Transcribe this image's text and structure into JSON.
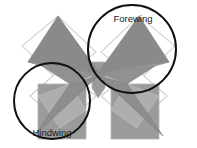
{
  "figure": {
    "background_color": "#ffffff",
    "width": 197,
    "height": 148,
    "palette": {
      "wing_fill_dark": "#8a8a8a",
      "wing_fill_mid": "#949494",
      "wing_fill_light": "#a8a8a8",
      "wing_fill_pale": "#c4c4c4",
      "outline_white": "#f4f4f4",
      "outline_gray": "#b9b9b9",
      "annotation_stroke": "#111111",
      "label_color": "#1a1a1a"
    },
    "annotations": [
      {
        "id": "forewing",
        "label": "Forewing",
        "circle": {
          "cx": 132,
          "cy": 49,
          "r": 44
        },
        "label_x": 133,
        "label_y": 22,
        "anchor": "middle"
      },
      {
        "id": "hindwing",
        "label": "Hindwing",
        "circle": {
          "cx": 52,
          "cy": 101,
          "r": 38
        },
        "label_x": 52,
        "label_y": 136,
        "anchor": "middle"
      }
    ],
    "shapes": {
      "outline_diamond_upper_left": "22,46 58,16 96,52 60,82",
      "outline_diamond_upper_right": "101,52 139,16 175,46 137,82",
      "outline_diamond_lower_left": "30,96 62,68 96,96 64,126",
      "outline_diamond_lower_right": "101,96 135,68 167,96 135,126",
      "rect_lower_left": "38,84 86,84 86,139 38,139",
      "rect_lower_right": "111,84 159,84 159,139 111,139",
      "wing_upper_left": "58,16 99,73 28,62",
      "wing_upper_right": "139,16 98,73 169,62",
      "wing_mid_left": "99,73 42,66 70,84",
      "wing_mid_right": "98,73 155,66 127,84",
      "wing_lower_left": "70,84 99,75 34,136",
      "wing_lower_right": "127,84 98,75 163,136",
      "body_upper": "92,62 105,62 105,88 98,98 92,88",
      "band_left": "28,62 99,73 42,66",
      "band_right": "169,62 98,73 155,66",
      "pale_lower_left": "38,96 70,84 86,110 60,128",
      "pale_lower_right": "159,96 127,84 111,110 137,128"
    }
  }
}
